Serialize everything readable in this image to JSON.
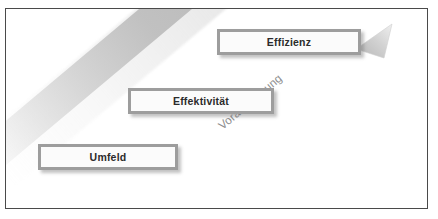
{
  "diagram": {
    "frame": {
      "border_color": "#4a4a4a",
      "background_color": "#ffffff"
    },
    "arrow": {
      "label": "Voraussetzung",
      "label_color": "#8d8d8d",
      "band_color": "#bebebe",
      "head_color": "#c9c9c9",
      "direction": "up-right",
      "head_icon": "arrow-triangle-icon"
    },
    "steps": [
      {
        "id": "umfeld",
        "label": "Umfeld",
        "level": 1,
        "border_color": "#9d9d9d",
        "fill_color": "#fbfbfb",
        "text_color": "#2b2b2b"
      },
      {
        "id": "effektivitaet",
        "label": "Effektivität",
        "level": 2,
        "border_color": "#9d9d9d",
        "fill_color": "#fbfbfb",
        "text_color": "#2b2b2b"
      },
      {
        "id": "effizienz",
        "label": "Effizienz",
        "level": 3,
        "border_color": "#9d9d9d",
        "fill_color": "#fbfbfb",
        "text_color": "#2b2b2b"
      }
    ]
  }
}
